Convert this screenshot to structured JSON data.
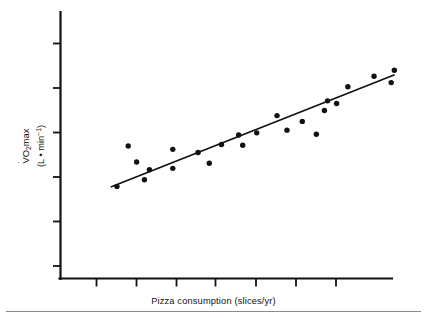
{
  "figure": {
    "background": "#ffffff",
    "ink_color": "#111111",
    "divider_color": "#8a8a8a"
  },
  "axis_labels": {
    "y_line1_prefix": "V",
    "y_line1_mid": "O",
    "y_line1_sub": "2",
    "y_line1_suffix": "max",
    "y_line2": "(L • min",
    "y_line2_sup": "−1",
    "y_line2_tail": ")",
    "y_full": "V̇O₂max (L • min⁻¹)",
    "x_full": "Pizza consumption (slices/yr)"
  },
  "chart_data": {
    "type": "scatter",
    "title": "",
    "subtitle": "",
    "xlabel": "Pizza consumption (slices/yr)",
    "ylabel": "V̇O₂max (L • min⁻¹)",
    "grid": false,
    "legend": null,
    "axis_tick_labels": {
      "x": [],
      "y": []
    },
    "x_tick_count": 7,
    "y_tick_count": 6,
    "xlim": [
      0,
      100
    ],
    "ylim": [
      0,
      100
    ],
    "annotations": [],
    "series": [
      {
        "name": "Observations",
        "marker": "filled-circle",
        "color": "#111111",
        "points": [
          {
            "x": 8.0,
            "y": 23.4
          },
          {
            "x": 11.6,
            "y": 44.3
          },
          {
            "x": 14.3,
            "y": 36.1
          },
          {
            "x": 16.8,
            "y": 26.9
          },
          {
            "x": 18.4,
            "y": 32.1
          },
          {
            "x": 25.9,
            "y": 42.6
          },
          {
            "x": 25.9,
            "y": 32.8
          },
          {
            "x": 34.0,
            "y": 41.0
          },
          {
            "x": 37.6,
            "y": 35.4
          },
          {
            "x": 41.5,
            "y": 45.1
          },
          {
            "x": 47.0,
            "y": 50.0
          },
          {
            "x": 48.3,
            "y": 44.7
          },
          {
            "x": 52.8,
            "y": 51.1
          },
          {
            "x": 59.3,
            "y": 60.0
          },
          {
            "x": 62.5,
            "y": 52.5
          },
          {
            "x": 67.4,
            "y": 57.0
          },
          {
            "x": 71.9,
            "y": 50.4
          },
          {
            "x": 74.5,
            "y": 62.6
          },
          {
            "x": 75.5,
            "y": 67.6
          },
          {
            "x": 78.4,
            "y": 66.2
          },
          {
            "x": 82.0,
            "y": 74.9
          },
          {
            "x": 90.4,
            "y": 80.3
          },
          {
            "x": 95.9,
            "y": 77.0
          },
          {
            "x": 96.9,
            "y": 83.4
          }
        ]
      }
    ],
    "trendline": {
      "name": "Least-squares regression line",
      "type": "linear",
      "x_start": 6.0,
      "y_start": 23.2,
      "x_end": 97.0,
      "y_end": 81.1,
      "color": "#111111"
    }
  }
}
